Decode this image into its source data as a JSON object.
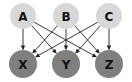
{
  "diagram": {
    "type": "bipartite-graph",
    "colors": {
      "top_fill": "#d8d8d8",
      "bottom_fill": "#7f7f7f",
      "edge": "#222222",
      "label": "#111111"
    },
    "top_nodes": [
      {
        "id": "A",
        "label": "A",
        "cx": 23,
        "cy": 16
      },
      {
        "id": "B",
        "label": "B",
        "cx": 66,
        "cy": 16
      },
      {
        "id": "C",
        "label": "C",
        "cx": 109,
        "cy": 16
      }
    ],
    "bottom_nodes": [
      {
        "id": "X",
        "label": "X",
        "cx": 23,
        "cy": 64
      },
      {
        "id": "Y",
        "label": "Y",
        "cx": 66,
        "cy": 64
      },
      {
        "id": "Z",
        "label": "Z",
        "cx": 109,
        "cy": 64
      }
    ],
    "edges": [
      {
        "from": "A",
        "to": "X"
      },
      {
        "from": "A",
        "to": "Y"
      },
      {
        "from": "A",
        "to": "Z"
      },
      {
        "from": "B",
        "to": "X"
      },
      {
        "from": "B",
        "to": "Y"
      },
      {
        "from": "B",
        "to": "Z"
      },
      {
        "from": "C",
        "to": "X"
      },
      {
        "from": "C",
        "to": "Y"
      },
      {
        "from": "C",
        "to": "Z"
      }
    ]
  }
}
